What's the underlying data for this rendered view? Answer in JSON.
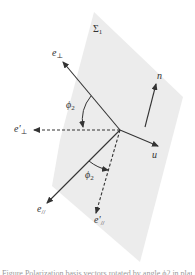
{
  "diagram": {
    "plane": {
      "label": "Σ",
      "label_sub": "1",
      "fill": "#ececec",
      "polygon": [
        [
          94,
          12
        ],
        [
          183,
          97
        ],
        [
          140,
          262
        ],
        [
          52,
          186
        ],
        [
          60,
          140
        ]
      ]
    },
    "origin": [
      120,
      130
    ],
    "vectors": [
      {
        "id": "e-perp",
        "label": "e",
        "label_sub": "⊥",
        "to": [
          63,
          62
        ],
        "dashed": false,
        "label_pos": [
          54,
          50
        ]
      },
      {
        "id": "e-perp-prime",
        "label": "e′",
        "label_sub": "⊥",
        "to": [
          34,
          130
        ],
        "dashed": true,
        "label_pos": [
          14,
          126
        ]
      },
      {
        "id": "u",
        "label": "u",
        "label_sub": "",
        "to": [
          158,
          146
        ],
        "dashed": false,
        "label_pos": [
          152,
          152
        ]
      },
      {
        "id": "e-par",
        "label": "e",
        "label_sub": "//",
        "to": [
          47,
          203
        ],
        "dashed": false,
        "label_pos": [
          38,
          205
        ]
      },
      {
        "id": "e-par-prime",
        "label": "e′",
        "label_sub": "//",
        "to": [
          96,
          213
        ],
        "dashed": true,
        "label_pos": [
          95,
          216
        ]
      },
      {
        "id": "n",
        "label": "n",
        "label_sub": "",
        "from": [
          145,
          127
        ],
        "to": [
          156,
          84
        ],
        "dashed": false,
        "label_pos": [
          158,
          73
        ]
      }
    ],
    "angles": [
      {
        "id": "phi2-upper",
        "label": "ϕ",
        "label_sub": "2",
        "label_pos": [
          67,
          103
        ]
      },
      {
        "id": "phi2-lower",
        "label": "ϕ",
        "label_sub": "2",
        "label_pos": [
          86,
          173
        ]
      }
    ],
    "line_color": "#333333"
  },
  "caption": "Figure  Polarization basis vectors rotated by angle ϕ2 in plane Σ1"
}
